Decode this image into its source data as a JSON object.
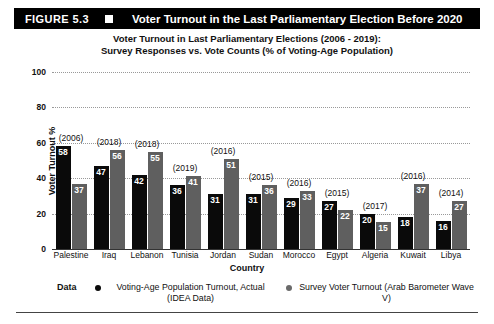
{
  "figure": {
    "number_label": "FIGURE 5.3",
    "header_title": "Voter Turnout in the Last Parliamentary Election Before 2020",
    "header_bg": "#000000",
    "header_fg": "#ffffff"
  },
  "axis": {
    "ylabel": "Voter Turnout %",
    "xlabel": "Country",
    "yticks": [
      "0",
      "20",
      "40",
      "60",
      "80",
      "100"
    ]
  },
  "legend": {
    "series_label": "Data",
    "entries": [
      {
        "marker": "black-dot-icon",
        "color": "#0a0a0a",
        "label": "Voting-Age Population Turnout, Actual (IDEA Data)"
      },
      {
        "marker": "gray-dot-icon",
        "color": "#6a6a6a",
        "label": "Survey Voter Turnout (Arab Barometer Wave V)"
      }
    ]
  },
  "chart_data": {
    "type": "bar",
    "title": "Voter Turnout in Last Parliamentary Elections (2006 - 2019):",
    "subtitle": "Survey Responses vs. Vote Counts (% of  Voting-Age Population)",
    "xlabel": "Country",
    "ylabel": "Voter Turnout %",
    "ylim": [
      0,
      100
    ],
    "ytick_step": 20,
    "grid": true,
    "grid_style": "dotted-horizontal",
    "legend_position": "bottom",
    "categories": [
      "Palestine",
      "Iraq",
      "Lebanon",
      "Tunisia",
      "Jordan",
      "Sudan",
      "Morocco",
      "Egypt",
      "Algeria",
      "Kuwait",
      "Libya"
    ],
    "annotations": [
      "(2006)",
      "(2018)",
      "(2018)",
      "(2019)",
      "(2016)",
      "(2015)",
      "(2016)",
      "(2015)",
      "(2017)",
      "(2016)",
      "(2014)"
    ],
    "series": [
      {
        "name": "Voting-Age Population Turnout, Actual (IDEA Data)",
        "color": "#0a0a0a",
        "values": [
          58,
          47,
          42,
          36,
          31,
          31,
          29,
          27,
          20,
          18,
          16
        ]
      },
      {
        "name": "Survey Voter Turnout (Arab Barometer Wave V)",
        "color": "#5f5f5f",
        "values": [
          37,
          56,
          55,
          41,
          51,
          36,
          33,
          22,
          15,
          37,
          27
        ]
      }
    ]
  }
}
